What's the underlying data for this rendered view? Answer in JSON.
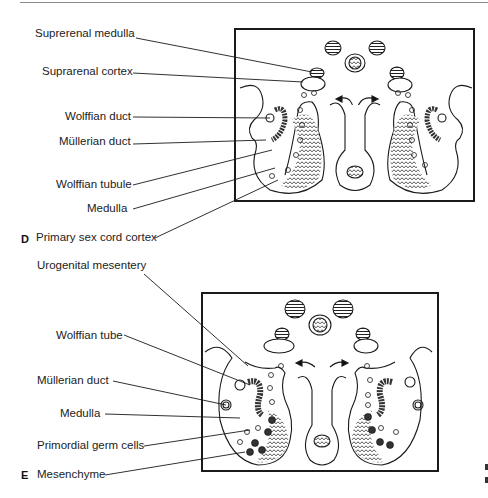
{
  "figure": {
    "panels": [
      {
        "letter": "D",
        "labels": [
          "Suprerenal medulla",
          "Suprarenal cortex",
          "Wolffian duct",
          "Müllerian duct",
          "Wolffian tubule",
          "Medulla",
          "Primary sex cord cortex"
        ]
      },
      {
        "letter": "E",
        "labels": [
          "Urogenital mesentery",
          "Wolffian tube",
          "Müllerian duct",
          "Medulla",
          "Primordial germ cells",
          "Mesenchyme"
        ]
      }
    ]
  }
}
